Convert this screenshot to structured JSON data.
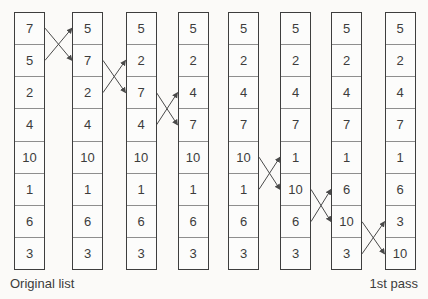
{
  "labels": {
    "original": "Original list",
    "pass": "1st pass"
  },
  "columns": [
    {
      "values": [
        "7",
        "5",
        "2",
        "4",
        "10",
        "1",
        "6",
        "3"
      ]
    },
    {
      "values": [
        "5",
        "7",
        "2",
        "4",
        "10",
        "1",
        "6",
        "3"
      ]
    },
    {
      "values": [
        "5",
        "2",
        "7",
        "4",
        "10",
        "1",
        "6",
        "3"
      ]
    },
    {
      "values": [
        "5",
        "2",
        "4",
        "7",
        "10",
        "1",
        "6",
        "3"
      ]
    },
    {
      "values": [
        "5",
        "2",
        "4",
        "7",
        "10",
        "1",
        "6",
        "3"
      ]
    },
    {
      "values": [
        "5",
        "2",
        "4",
        "7",
        "1",
        "10",
        "6",
        "3"
      ]
    },
    {
      "values": [
        "5",
        "2",
        "4",
        "7",
        "1",
        "6",
        "10",
        "3"
      ]
    },
    {
      "values": [
        "5",
        "2",
        "4",
        "7",
        "1",
        "6",
        "3",
        "10"
      ]
    }
  ],
  "swaps": [
    {
      "from_column": 1,
      "to_column": 2,
      "rows": [
        1,
        2
      ]
    },
    {
      "from_column": 2,
      "to_column": 3,
      "rows": [
        2,
        3
      ]
    },
    {
      "from_column": 3,
      "to_column": 4,
      "rows": [
        3,
        4
      ]
    },
    {
      "from_column": 5,
      "to_column": 6,
      "rows": [
        5,
        6
      ]
    },
    {
      "from_column": 6,
      "to_column": 7,
      "rows": [
        6,
        7
      ]
    },
    {
      "from_column": 7,
      "to_column": 8,
      "rows": [
        7,
        8
      ]
    }
  ],
  "colors": {
    "background": "#fbfaf8",
    "cell_background": "#fcfcfb",
    "box_border": "#3e3e3e",
    "row_divider": "#8e8e8e",
    "text": "#3c3c3c",
    "arrow": "#4a4a4a"
  }
}
